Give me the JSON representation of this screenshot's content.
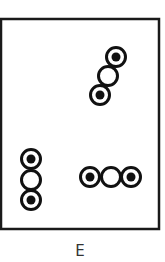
{
  "figure": {
    "label": "E",
    "frame": {
      "x": 1,
      "y": 19,
      "width": 158,
      "height": 210,
      "stroke": "#1a1a1a",
      "stroke_width": 2.5
    },
    "circle_style": {
      "radius": 9.5,
      "ring_width": 3,
      "dot_radius": 4.5,
      "color": "#111111",
      "fill": "#ffffff"
    },
    "groups": [
      {
        "name": "diagonal-chain",
        "circles": [
          {
            "cx": 116,
            "cy": 57,
            "dot": true
          },
          {
            "cx": 108,
            "cy": 76,
            "dot": false
          },
          {
            "cx": 100,
            "cy": 95,
            "dot": true
          }
        ]
      },
      {
        "name": "vertical-chain",
        "circles": [
          {
            "cx": 31,
            "cy": 159,
            "dot": true
          },
          {
            "cx": 31,
            "cy": 180,
            "dot": false
          },
          {
            "cx": 31,
            "cy": 200,
            "dot": true
          }
        ]
      },
      {
        "name": "horizontal-chain",
        "circles": [
          {
            "cx": 90,
            "cy": 177,
            "dot": true
          },
          {
            "cx": 111,
            "cy": 177,
            "dot": false
          },
          {
            "cx": 131,
            "cy": 177,
            "dot": true
          }
        ]
      }
    ]
  }
}
